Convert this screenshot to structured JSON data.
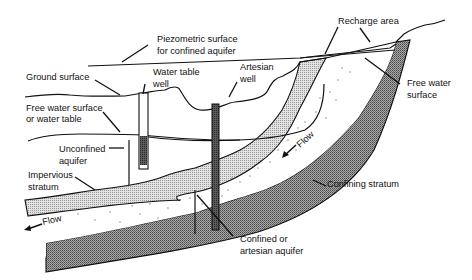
{
  "diagram": {
    "labels": {
      "piezometric_1": "Piezometric surface",
      "piezometric_2": "for confined aquifer",
      "recharge_area": "Recharge area",
      "ground_surface": "Ground surface",
      "water_table_well_1": "Water table",
      "water_table_well_2": "well",
      "artesian_well_1": "Artesian",
      "artesian_well_2": "well",
      "free_water_surface_right_1": "Free water",
      "free_water_surface_right_2": "surface",
      "free_water_left_1": "Free water surface",
      "free_water_left_2": "or water table",
      "unconfined_aquifer_1": "Unconfined",
      "unconfined_aquifer_2": "aquifer",
      "impervious_stratum_1": "Impervious",
      "impervious_stratum_2": "stratum",
      "flow_upper": "Flow",
      "flow_lower": "Flow",
      "confining_stratum": "Confining stratum",
      "confined_aquifer_1": "Confined or",
      "confined_aquifer_2": "artesian aquifer"
    },
    "colors": {
      "line": "#111111",
      "impervious_fill": "#d4d4d4",
      "confining_fill": "#8a8a8a",
      "well_fill": "#555555",
      "aquifer_fill": "#ffffff",
      "dots": "#888888"
    }
  }
}
